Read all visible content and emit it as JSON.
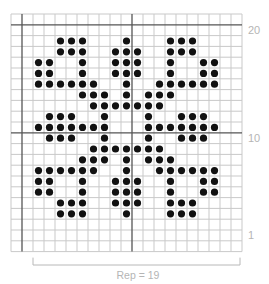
{
  "chart_data": {
    "type": "knitting-chart",
    "columns": 21,
    "rows": 22,
    "grid": {
      "left": 11,
      "top": 14,
      "cell_w": 11,
      "cell_h": 10.8,
      "thick_cols": [
        1,
        11
      ],
      "thick_rows": [
        1,
        11
      ]
    },
    "colors": {
      "grid": "#c9c9c9",
      "thick": "#555555",
      "dot": "#111111",
      "label": "#b5b5b5"
    },
    "row_labels": [
      {
        "text": "20",
        "row": 1
      },
      {
        "text": "10",
        "row": 11
      },
      {
        "text": "1",
        "row": 20
      }
    ],
    "repeat": {
      "label": "Rep = 19",
      "from_col": 2,
      "to_col": 20
    },
    "dots": {
      "2": [
        4,
        5,
        6,
        10,
        14,
        15,
        16
      ],
      "3": [
        4,
        5,
        6,
        9,
        10,
        11,
        14,
        15,
        16
      ],
      "4": [
        2,
        3,
        6,
        9,
        10,
        11,
        14,
        17,
        18
      ],
      "5": [
        2,
        3,
        6,
        9,
        10,
        11,
        14,
        17,
        18
      ],
      "6": [
        2,
        3,
        4,
        5,
        6,
        7,
        10,
        13,
        14,
        15,
        16,
        17,
        18
      ],
      "7": [
        6,
        7,
        8,
        10,
        12,
        13,
        14
      ],
      "8": [
        7,
        8,
        9,
        10,
        11,
        12,
        13
      ],
      "9": [
        3,
        4,
        5,
        8,
        12,
        15,
        16,
        17
      ],
      "10": [
        2,
        3,
        4,
        5,
        6,
        7,
        8,
        12,
        13,
        14,
        15,
        16,
        17,
        18
      ],
      "11": [
        3,
        4,
        5,
        8,
        12,
        15,
        16,
        17
      ],
      "12": [
        7,
        8,
        9,
        10,
        11,
        12,
        13
      ],
      "13": [
        6,
        7,
        8,
        10,
        12,
        13,
        14
      ],
      "14": [
        2,
        3,
        4,
        5,
        6,
        7,
        10,
        13,
        14,
        15,
        16,
        17,
        18
      ],
      "15": [
        2,
        3,
        6,
        9,
        10,
        11,
        14,
        17,
        18
      ],
      "16": [
        2,
        3,
        6,
        9,
        10,
        11,
        14,
        17,
        18
      ],
      "17": [
        4,
        5,
        6,
        9,
        10,
        11,
        14,
        15,
        16
      ],
      "18": [
        4,
        5,
        6,
        10,
        14,
        15,
        16
      ]
    }
  }
}
